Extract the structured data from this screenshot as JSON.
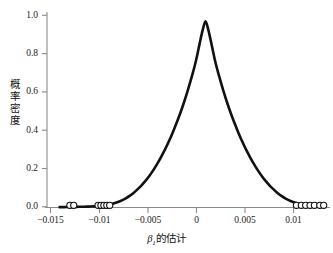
{
  "chart_data": {
    "type": "line",
    "title": "",
    "subtitle": "",
    "xlabel": "β₁的估计",
    "xlabel_parts": {
      "symbol": "β",
      "subscript": "1",
      "suffix": "的估计"
    },
    "ylabel": "概率密度",
    "ylabel_chars": [
      "概",
      "率",
      "密",
      "度"
    ],
    "xlim": [
      -0.0163,
      0.0128
    ],
    "ylim": [
      0.0,
      1.06
    ],
    "xticks": [
      -0.015,
      -0.01,
      -0.005,
      0,
      0.005,
      0.01
    ],
    "xtick_labels": [
      "−0.015",
      "−0.01",
      "−0.005",
      "0",
      "0.005",
      "0.01"
    ],
    "yticks": [
      0.0,
      0.2,
      0.4,
      0.6,
      0.8,
      1.0
    ],
    "ytick_labels": [
      "0.0",
      "0.2",
      "0.4",
      "0.6",
      "0.8",
      "1.0"
    ],
    "grid": false,
    "legend": null,
    "curve_color": "#111111",
    "curve_width": 2.6,
    "axis_color": "#8c8c8c",
    "marker_color": "#111111",
    "marker_shape": "open-circle",
    "series": [
      {
        "name": "density",
        "type": "line",
        "x": [
          -0.015,
          -0.0145,
          -0.014,
          -0.0135,
          -0.013,
          -0.0125,
          -0.012,
          -0.0115,
          -0.011,
          -0.0106,
          -0.0102,
          -0.0098,
          -0.0094,
          -0.009,
          -0.0086,
          -0.0082,
          -0.0078,
          -0.0074,
          -0.007,
          -0.0066,
          -0.0062,
          -0.0058,
          -0.0054,
          -0.005,
          -0.0046,
          -0.0042,
          -0.0038,
          -0.0034,
          -0.003,
          -0.0026,
          -0.0022,
          -0.0018,
          -0.0014,
          -0.001,
          -0.0006,
          -0.0003,
          0.0,
          0.0003,
          0.0006,
          0.001,
          0.0014,
          0.0018,
          0.0022,
          0.0026,
          0.003,
          0.0034,
          0.0038,
          0.0042,
          0.0046,
          0.005,
          0.0054,
          0.0058,
          0.0062,
          0.0066,
          0.007,
          0.0074,
          0.0078,
          0.0082,
          0.0086,
          0.009,
          0.0094,
          0.0098,
          0.0102,
          0.0106,
          0.011,
          0.0115,
          0.012
        ],
        "y": [
          0.002,
          0.002,
          0.003,
          0.003,
          0.004,
          0.004,
          0.005,
          0.006,
          0.008,
          0.01,
          0.013,
          0.017,
          0.023,
          0.03,
          0.039,
          0.05,
          0.063,
          0.079,
          0.098,
          0.119,
          0.143,
          0.17,
          0.2,
          0.234,
          0.271,
          0.311,
          0.355,
          0.403,
          0.455,
          0.511,
          0.572,
          0.639,
          0.712,
          0.792,
          0.89,
          0.96,
          1.01,
          0.96,
          0.89,
          0.792,
          0.712,
          0.639,
          0.572,
          0.511,
          0.455,
          0.403,
          0.355,
          0.311,
          0.271,
          0.234,
          0.2,
          0.17,
          0.143,
          0.119,
          0.098,
          0.079,
          0.063,
          0.05,
          0.039,
          0.03,
          0.023,
          0.017,
          0.013,
          0.01,
          0.008,
          0.006,
          0.005
        ],
        "peak_x": 0.0,
        "peak_y": 1.01
      },
      {
        "name": "observations",
        "type": "scatter",
        "x": [
          -0.01395,
          -0.01355,
          -0.01105,
          -0.01075,
          -0.01045,
          -0.01015,
          -0.00985,
          0.00935,
          0.00985,
          0.0103,
          0.01075,
          0.0112,
          0.01175,
          0.01215
        ],
        "y": [
          0,
          0,
          0,
          0,
          0,
          0,
          0,
          0,
          0,
          0,
          0,
          0,
          0,
          0
        ],
        "count": 14
      }
    ]
  }
}
